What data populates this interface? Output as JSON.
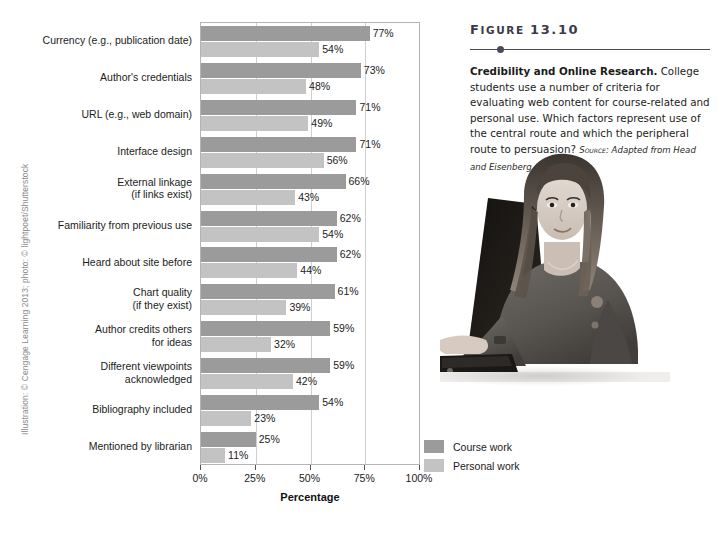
{
  "credit": "Illustration: © Cengage Learning 2013; photo: © lightpoet/Shutterstock",
  "figure": {
    "heading_prefix": "F",
    "heading_rest": "IGURE ",
    "heading_number": "13.10",
    "title": "Credibility and Online Research.",
    "body": " College students use a number of criteria for evaluating web content for course-related and personal use. Which factors represent use of the central route and which the peripheral route to persuasion? ",
    "source_word": "Source:",
    "source_text": " Adapted from Head and Eisenberg (2010)."
  },
  "legend": {
    "items": [
      {
        "label": "Course work",
        "color": "#9b9b9b",
        "key": "course"
      },
      {
        "label": "Personal work",
        "color": "#c3c3c3",
        "key": "personal"
      }
    ]
  },
  "photo": {
    "alt": "Young woman working on a laptop computer",
    "name": "student-laptop-photo"
  },
  "chart_data": {
    "type": "bar",
    "orientation": "horizontal",
    "title": "Credibility and Online Research",
    "xlabel": "Percentage",
    "ylabel": "",
    "xlim": [
      0,
      100
    ],
    "xticks": [
      "0%",
      "25%",
      "50%",
      "75%",
      "100%"
    ],
    "xtick_values": [
      0,
      25,
      50,
      75,
      100
    ],
    "grid": true,
    "legend_position": "right-bottom",
    "categories": [
      "Currency (e.g., publication date)",
      "Author's credentials",
      "URL (e.g., web domain)",
      "Interface design",
      "External linkage (if links exist)",
      "Familiarity from previous use",
      "Heard about site before",
      "Chart quality (if they exist)",
      "Author credits others for ideas",
      "Different viewpoints acknowledged",
      "Bibliography included",
      "Mentioned by librarian"
    ],
    "category_lines": [
      [
        "Currency (e.g., publication date)"
      ],
      [
        "Author's credentials"
      ],
      [
        "URL (e.g., web domain)"
      ],
      [
        "Interface design"
      ],
      [
        "External linkage",
        "(if links exist)"
      ],
      [
        "Familiarity from previous use"
      ],
      [
        "Heard about site before"
      ],
      [
        "Chart quality",
        "(if they exist)"
      ],
      [
        "Author credits others",
        "for ideas"
      ],
      [
        "Different viewpoints",
        "acknowledged"
      ],
      [
        "Bibliography included"
      ],
      [
        "Mentioned by librarian"
      ]
    ],
    "series": [
      {
        "name": "Course work",
        "key": "course",
        "color": "#9b9b9b",
        "values": [
          77,
          73,
          71,
          71,
          66,
          62,
          62,
          61,
          59,
          59,
          54,
          25
        ],
        "labels": [
          "77%",
          "73%",
          "71%",
          "71%",
          "66%",
          "62%",
          "62%",
          "61%",
          "59%",
          "59%",
          "54%",
          "25%"
        ]
      },
      {
        "name": "Personal work",
        "key": "personal",
        "color": "#c3c3c3",
        "values": [
          54,
          48,
          49,
          56,
          43,
          54,
          44,
          39,
          32,
          42,
          23,
          11
        ],
        "labels": [
          "54%",
          "48%",
          "49%",
          "56%",
          "43%",
          "54%",
          "44%",
          "39%",
          "32%",
          "42%",
          "23%",
          "11%"
        ]
      }
    ]
  }
}
